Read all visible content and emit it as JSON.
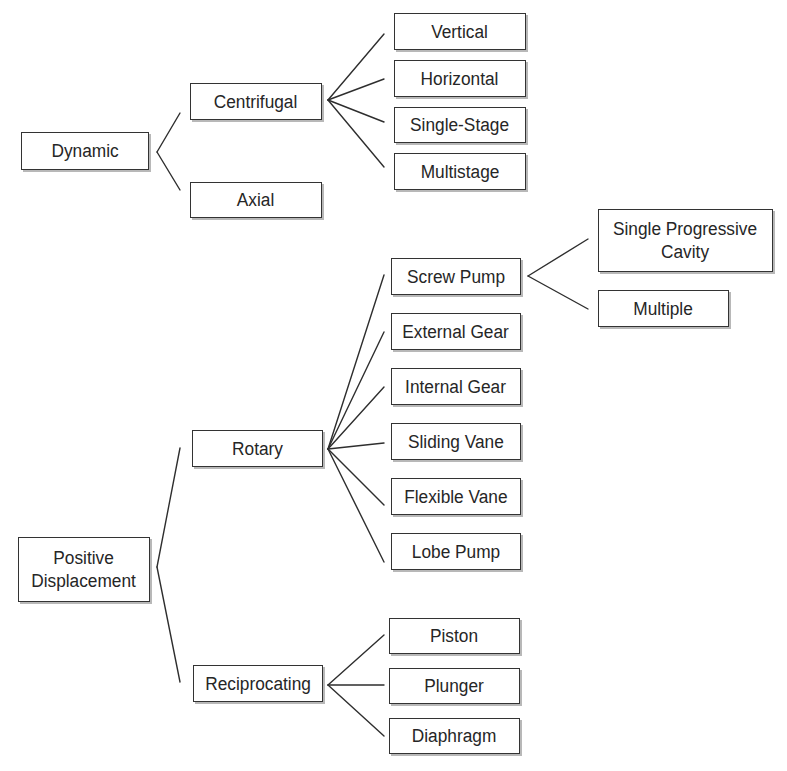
{
  "diagram": {
    "type": "tree",
    "colors": {
      "line": "#2e2e2e",
      "box_border": "#333333",
      "box_fill": "#ffffff",
      "text": "#262626",
      "shadow": "#b8b8b8",
      "background": "#ffffff"
    },
    "nodes": {
      "dynamic": {
        "label": "Dynamic",
        "box": [
          21,
          132,
          128,
          38
        ]
      },
      "centrifugal": {
        "label": "Centrifugal",
        "box": [
          190,
          83,
          132,
          37
        ]
      },
      "axial": {
        "label": "Axial",
        "box": [
          190,
          182,
          132,
          36
        ]
      },
      "vertical": {
        "label": "Vertical",
        "box": [
          394,
          13,
          132,
          37
        ]
      },
      "horizontal": {
        "label": "Horizontal",
        "box": [
          394,
          60,
          132,
          37
        ]
      },
      "single_stage": {
        "label": "Single-Stage",
        "box": [
          394,
          107,
          132,
          36
        ]
      },
      "multistage": {
        "label": "Multistage",
        "box": [
          394,
          153,
          132,
          37
        ]
      },
      "positive_displacement": {
        "label": "Positive\nDisplacement",
        "box": [
          18,
          537,
          132,
          65
        ]
      },
      "rotary": {
        "label": "Rotary",
        "box": [
          192,
          430,
          131,
          37
        ]
      },
      "reciprocating": {
        "label": "Reciprocating",
        "box": [
          193,
          665,
          130,
          37
        ]
      },
      "screw_pump": {
        "label": "Screw Pump",
        "box": [
          391,
          258,
          130,
          37
        ]
      },
      "external_gear": {
        "label": "External Gear",
        "box": [
          391,
          313,
          130,
          37
        ]
      },
      "internal_gear": {
        "label": "Internal Gear",
        "box": [
          391,
          368,
          130,
          37
        ]
      },
      "sliding_vane": {
        "label": "Sliding Vane",
        "box": [
          391,
          423,
          130,
          37
        ]
      },
      "flexible_vane": {
        "label": "Flexible Vane",
        "box": [
          391,
          478,
          130,
          37
        ]
      },
      "lobe_pump": {
        "label": "Lobe Pump",
        "box": [
          391,
          533,
          130,
          37
        ]
      },
      "single_progressive_cavity": {
        "label": "Single Progressive\nCavity",
        "box": [
          598,
          209,
          175,
          63
        ]
      },
      "multiple": {
        "label": "Multiple",
        "box": [
          598,
          290,
          131,
          37
        ]
      },
      "piston": {
        "label": "Piston",
        "box": [
          389,
          618,
          131,
          36
        ]
      },
      "plunger": {
        "label": "Plunger",
        "box": [
          389,
          668,
          131,
          36
        ]
      },
      "diaphragm": {
        "label": "Diaphragm",
        "box": [
          389,
          718,
          131,
          36
        ]
      }
    },
    "edges": [
      {
        "from": "dynamic",
        "to": "centrifugal"
      },
      {
        "from": "dynamic",
        "to": "axial"
      },
      {
        "from": "centrifugal",
        "to": "vertical"
      },
      {
        "from": "centrifugal",
        "to": "horizontal"
      },
      {
        "from": "centrifugal",
        "to": "single_stage"
      },
      {
        "from": "centrifugal",
        "to": "multistage"
      },
      {
        "from": "positive_displacement",
        "to": "rotary"
      },
      {
        "from": "positive_displacement",
        "to": "reciprocating"
      },
      {
        "from": "rotary",
        "to": "screw_pump"
      },
      {
        "from": "rotary",
        "to": "external_gear"
      },
      {
        "from": "rotary",
        "to": "internal_gear"
      },
      {
        "from": "rotary",
        "to": "sliding_vane"
      },
      {
        "from": "rotary",
        "to": "flexible_vane"
      },
      {
        "from": "rotary",
        "to": "lobe_pump"
      },
      {
        "from": "screw_pump",
        "to": "single_progressive_cavity"
      },
      {
        "from": "screw_pump",
        "to": "multiple"
      },
      {
        "from": "reciprocating",
        "to": "piston"
      },
      {
        "from": "reciprocating",
        "to": "plunger"
      },
      {
        "from": "reciprocating",
        "to": "diaphragm"
      }
    ],
    "connector_lines": [
      {
        "group": "dynamic",
        "x1": 157,
        "y1": 152,
        "x2": 180,
        "y2": 113
      },
      {
        "group": "dynamic",
        "x1": 157,
        "y1": 152,
        "x2": 180,
        "y2": 190
      },
      {
        "group": "centrifugal",
        "x1": 328,
        "y1": 100,
        "x2": 384,
        "y2": 34
      },
      {
        "group": "centrifugal",
        "x1": 328,
        "y1": 100,
        "x2": 384,
        "y2": 79
      },
      {
        "group": "centrifugal",
        "x1": 328,
        "y1": 100,
        "x2": 384,
        "y2": 122
      },
      {
        "group": "centrifugal",
        "x1": 328,
        "y1": 100,
        "x2": 384,
        "y2": 167
      },
      {
        "group": "positive_displacement",
        "x1": 157,
        "y1": 567,
        "x2": 180,
        "y2": 448
      },
      {
        "group": "positive_displacement",
        "x1": 157,
        "y1": 567,
        "x2": 180,
        "y2": 682
      },
      {
        "group": "rotary",
        "x1": 328,
        "y1": 449,
        "x2": 384,
        "y2": 275
      },
      {
        "group": "rotary",
        "x1": 328,
        "y1": 449,
        "x2": 384,
        "y2": 332
      },
      {
        "group": "rotary",
        "x1": 328,
        "y1": 449,
        "x2": 384,
        "y2": 387
      },
      {
        "group": "rotary",
        "x1": 328,
        "y1": 449,
        "x2": 384,
        "y2": 443
      },
      {
        "group": "rotary",
        "x1": 328,
        "y1": 449,
        "x2": 384,
        "y2": 505
      },
      {
        "group": "rotary",
        "x1": 328,
        "y1": 449,
        "x2": 384,
        "y2": 562
      },
      {
        "group": "screw_pump",
        "x1": 528,
        "y1": 276,
        "x2": 588,
        "y2": 239
      },
      {
        "group": "screw_pump",
        "x1": 528,
        "y1": 276,
        "x2": 588,
        "y2": 309
      },
      {
        "group": "reciprocating",
        "x1": 328,
        "y1": 685,
        "x2": 384,
        "y2": 635
      },
      {
        "group": "reciprocating",
        "x1": 328,
        "y1": 685,
        "x2": 384,
        "y2": 685
      },
      {
        "group": "reciprocating",
        "x1": 328,
        "y1": 685,
        "x2": 384,
        "y2": 736
      }
    ]
  }
}
